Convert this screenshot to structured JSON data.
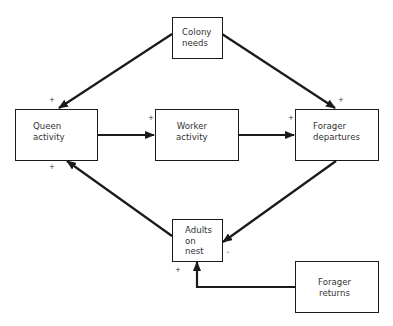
{
  "diagram": {
    "nodes": {
      "colony_needs": {
        "label": "Colony\nneeds"
      },
      "queen_activity": {
        "label": "Queen\nactivity"
      },
      "worker_activity": {
        "label": "Worker\nactivity"
      },
      "forager_departures": {
        "label": "Forager\ndepartures"
      },
      "adults_on_nest": {
        "label": "Adults\non\nnest"
      },
      "forager_returns": {
        "label": "Forager\nreturns"
      }
    },
    "edges": [
      {
        "from": "colony_needs",
        "to": "queen_activity",
        "sign": "+"
      },
      {
        "from": "colony_needs",
        "to": "forager_departures",
        "sign": "+"
      },
      {
        "from": "queen_activity",
        "to": "worker_activity",
        "sign": "+"
      },
      {
        "from": "worker_activity",
        "to": "forager_departures",
        "sign": "+"
      },
      {
        "from": "forager_departures",
        "to": "adults_on_nest",
        "sign": "–"
      },
      {
        "from": "adults_on_nest",
        "to": "queen_activity",
        "sign": "+"
      },
      {
        "from": "forager_returns",
        "to": "adults_on_nest",
        "sign": "+"
      }
    ],
    "line_color": "#1a1a1a"
  }
}
